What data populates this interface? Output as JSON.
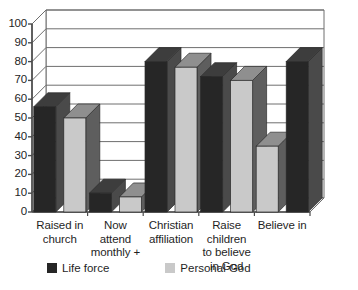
{
  "chart_data": {
    "type": "bar",
    "title": "",
    "subtitle": "",
    "xlabel": "",
    "ylabel": "",
    "ylim": [
      0,
      100
    ],
    "yticks": [
      0,
      10,
      20,
      30,
      40,
      50,
      60,
      70,
      80,
      90,
      100
    ],
    "ytick_labels": [
      "0",
      "10",
      "20",
      "30",
      "40",
      "50",
      "60",
      "70",
      "80",
      "90",
      "100"
    ],
    "grid": true,
    "three_d": true,
    "legend_position": "bottom",
    "categories": [
      "Raised in church",
      "Now attend monthly +",
      "Christian affiliation",
      "Raise children to believe in God",
      "Believe in"
    ],
    "category_lines": [
      [
        "Raised in",
        "church"
      ],
      [
        "Now",
        "attend",
        "monthly +"
      ],
      [
        "Christian",
        "affiliation"
      ],
      [
        "Raise",
        "children",
        "to believe",
        "in God"
      ],
      [
        "Believe in"
      ]
    ],
    "series": [
      {
        "name": "Life force",
        "color": "#262626",
        "side_color": "#4a4a4a",
        "top_color": "#3d3d3d",
        "values": [
          56,
          10,
          80,
          72,
          80
        ]
      },
      {
        "name": "Personal God",
        "color": "#c9c9c9",
        "side_color": "#5e5e5e",
        "top_color": "#8f8f8f",
        "values": [
          50,
          8,
          77,
          70,
          35
        ]
      }
    ],
    "annotations": []
  },
  "legend": {
    "entries": [
      {
        "label": "Life force",
        "swatch_color": "#262626"
      },
      {
        "label": "Personal God",
        "swatch_color": "#c9c9c9"
      }
    ]
  },
  "colors": {
    "plot_background": "#ffffff",
    "grid_line": "#6e6e6e",
    "axis_line": "#4a4a4a",
    "text": "#1f1f1f"
  }
}
